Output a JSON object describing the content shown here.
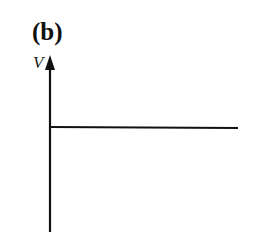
{
  "figure": {
    "panel_label": "(b)",
    "y_axis_label": "V",
    "x_axis_label": "",
    "curve": "constant horizontal line",
    "colors": {
      "line": "#111111",
      "background": "#ffffff"
    }
  }
}
